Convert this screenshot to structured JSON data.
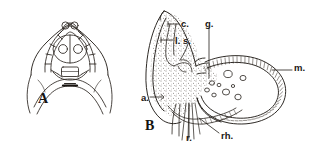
{
  "figure": {
    "background_color": "#ffffff",
    "ink_color": "#1a1714",
    "caption_panels": [
      {
        "id": "A",
        "label": "A",
        "description": "anterior end of animal, dorsal view showing head capsule cells and paired eyespots"
      },
      {
        "id": "B",
        "label": "B",
        "description": "sagittal section through anterior region showing stylet, glands and bursa"
      }
    ],
    "annotations": [
      {
        "key": "c",
        "label": "c.",
        "meaning": "cirrus"
      },
      {
        "key": "ls",
        "label": "l. s.",
        "meaning": "lateral sac"
      },
      {
        "key": "g",
        "label": "g.",
        "meaning": "gland"
      },
      {
        "key": "m",
        "label": "m.",
        "meaning": "muscle layer"
      },
      {
        "key": "a",
        "label": "a.",
        "meaning": "atrium"
      },
      {
        "key": "r",
        "label": "r.",
        "meaning": "rod"
      },
      {
        "key": "rh",
        "label": "rh.",
        "meaning": "rhabdite"
      }
    ]
  }
}
